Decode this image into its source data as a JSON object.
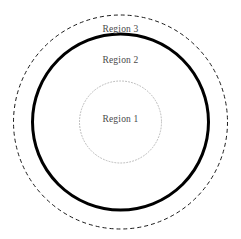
{
  "diagram": {
    "type": "concentric-circles",
    "background_color": "#ffffff",
    "canvas": {
      "width": 241,
      "height": 239
    },
    "center": {
      "x": 120.5,
      "y": 122
    },
    "labels": {
      "region_3": "Region 3",
      "region_2": "Region 2",
      "region_1": "Region 1"
    },
    "label_color": "#4a4a4a",
    "circles": [
      {
        "name": "outer-dashed-circle",
        "region": "Region 3",
        "radius": 107,
        "stroke_color": "#1a1a1a",
        "stroke_width": 1,
        "stroke_style": "dashed",
        "dash_pattern": "4 3",
        "fill": "none"
      },
      {
        "name": "middle-solid-circle",
        "region": "Region 2",
        "radius": 88,
        "stroke_color": "#000000",
        "stroke_width": 3,
        "stroke_style": "solid",
        "dash_pattern": "",
        "fill": "none"
      },
      {
        "name": "inner-dotted-circle",
        "region": "Region 1",
        "radius": 41,
        "stroke_color": "#b8b8b8",
        "stroke_width": 1,
        "stroke_style": "dotted",
        "dash_pattern": "1 2",
        "fill": "none"
      }
    ]
  }
}
